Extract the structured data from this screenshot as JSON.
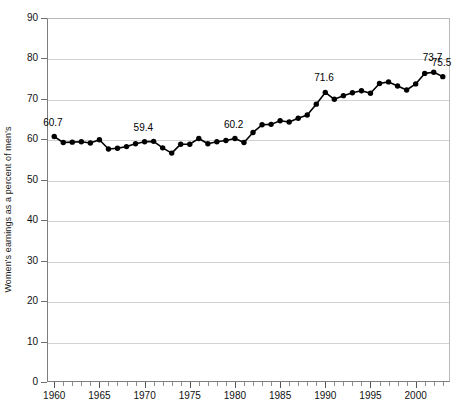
{
  "chart_data": {
    "type": "line",
    "title": "",
    "xlabel": "",
    "ylabel": "Women's earnings as a percent of men's",
    "xlim": [
      1959.2,
      2003.8
    ],
    "ylim": [
      0,
      90
    ],
    "grid": true,
    "legend": null,
    "y_ticks": [
      0,
      10,
      20,
      30,
      40,
      50,
      60,
      70,
      80,
      90
    ],
    "x_ticks_major": [
      1960,
      1965,
      1970,
      1975,
      1980,
      1985,
      1990,
      1995,
      2000
    ],
    "x_tick_labels": [
      "1960",
      "1965",
      "1970",
      "1975",
      "1980",
      "1985",
      "1990",
      "1995",
      "2000"
    ],
    "x_minor_step": 1,
    "series": [
      {
        "name": "Women's earnings as a percent of men's",
        "color": "#000000",
        "marker": "circle",
        "x": [
          1960,
          1961,
          1962,
          1963,
          1964,
          1965,
          1966,
          1967,
          1968,
          1969,
          1970,
          1971,
          1972,
          1973,
          1974,
          1975,
          1976,
          1977,
          1978,
          1979,
          1980,
          1981,
          1982,
          1983,
          1984,
          1985,
          1986,
          1987,
          1988,
          1989,
          1990,
          1991,
          1992,
          1993,
          1994,
          1995,
          1996,
          1997,
          1998,
          1999,
          2000,
          2001,
          2002,
          2003
        ],
        "values": [
          60.7,
          59.2,
          59.3,
          59.4,
          59.1,
          59.9,
          57.6,
          57.8,
          58.2,
          58.9,
          59.4,
          59.5,
          57.9,
          56.6,
          58.8,
          58.8,
          60.2,
          58.9,
          59.4,
          59.7,
          60.2,
          59.2,
          61.7,
          63.6,
          63.7,
          64.6,
          64.3,
          65.2,
          66.0,
          68.7,
          71.6,
          69.9,
          70.8,
          71.5,
          72.0,
          71.4,
          73.8,
          74.2,
          73.2,
          72.2,
          73.7,
          76.3,
          76.6,
          75.5
        ]
      }
    ],
    "annotations": [
      {
        "x": 1960,
        "value": 60.7,
        "text": "60.7"
      },
      {
        "x": 1970,
        "value": 59.4,
        "text": "59.4"
      },
      {
        "x": 1980,
        "value": 60.2,
        "text": "60.2"
      },
      {
        "x": 1990,
        "value": 71.6,
        "text": "71.6"
      },
      {
        "x": 2002,
        "value": 76.6,
        "text": "73.7"
      },
      {
        "x": 2003,
        "value": 75.5,
        "text": "75.5"
      }
    ]
  }
}
